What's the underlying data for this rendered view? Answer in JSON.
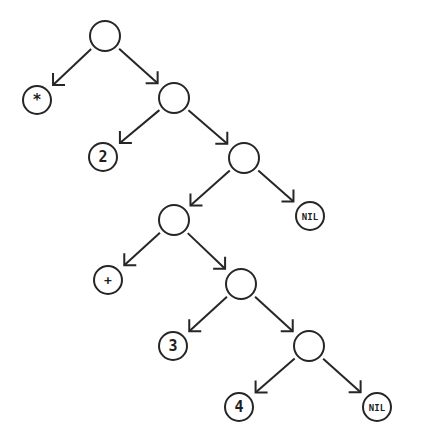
{
  "diagram": {
    "stroke_color": "#262626",
    "background": "#ffffff",
    "node_radius": 15,
    "nodes": [
      {
        "id": "c1",
        "type": "cons",
        "label": "",
        "x": 105,
        "y": 36
      },
      {
        "id": "star",
        "type": "atom",
        "label": "*",
        "x": 37,
        "y": 100
      },
      {
        "id": "c2",
        "type": "cons",
        "label": "",
        "x": 174,
        "y": 98
      },
      {
        "id": "two",
        "type": "atom",
        "label": "2",
        "x": 103,
        "y": 157
      },
      {
        "id": "c3",
        "type": "cons",
        "label": "",
        "x": 244,
        "y": 158
      },
      {
        "id": "nil1",
        "type": "nil",
        "label": "NIL",
        "x": 310,
        "y": 216
      },
      {
        "id": "c4",
        "type": "cons",
        "label": "",
        "x": 174,
        "y": 220
      },
      {
        "id": "plus",
        "type": "atom",
        "label": "+",
        "x": 108,
        "y": 280
      },
      {
        "id": "c5",
        "type": "cons",
        "label": "",
        "x": 241,
        "y": 284
      },
      {
        "id": "three",
        "type": "atom",
        "label": "3",
        "x": 173,
        "y": 346
      },
      {
        "id": "c6",
        "type": "cons",
        "label": "",
        "x": 309,
        "y": 346
      },
      {
        "id": "four",
        "type": "atom",
        "label": "4",
        "x": 239,
        "y": 407
      },
      {
        "id": "nil2",
        "type": "nil",
        "label": "NIL",
        "x": 377,
        "y": 407
      }
    ],
    "edges": [
      {
        "from": "c1",
        "to": "star"
      },
      {
        "from": "c1",
        "to": "c2"
      },
      {
        "from": "c2",
        "to": "two"
      },
      {
        "from": "c2",
        "to": "c3"
      },
      {
        "from": "c3",
        "to": "c4"
      },
      {
        "from": "c3",
        "to": "nil1"
      },
      {
        "from": "c4",
        "to": "plus"
      },
      {
        "from": "c4",
        "to": "c5"
      },
      {
        "from": "c5",
        "to": "three"
      },
      {
        "from": "c5",
        "to": "c6"
      },
      {
        "from": "c6",
        "to": "four"
      },
      {
        "from": "c6",
        "to": "nil2"
      }
    ]
  }
}
